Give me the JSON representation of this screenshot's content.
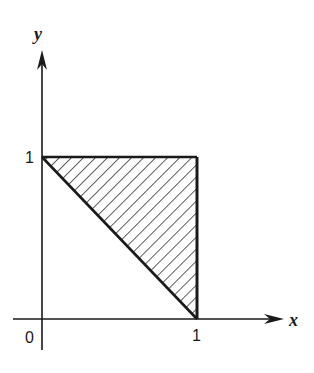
{
  "diagram": {
    "type": "region-plot",
    "axes": {
      "x_label": "x",
      "y_label": "y",
      "origin_label": "0",
      "x_tick_label": "1",
      "y_tick_label": "1"
    },
    "region": {
      "vertices": [
        [
          0,
          1
        ],
        [
          1,
          1
        ],
        [
          1,
          0
        ]
      ],
      "fill": "diagonal-hatch",
      "boundary": [
        "y = 1",
        "x = 1",
        "x + y = 1"
      ]
    },
    "colors": {
      "ink": "#1a1a1a",
      "background": "#ffffff"
    }
  }
}
